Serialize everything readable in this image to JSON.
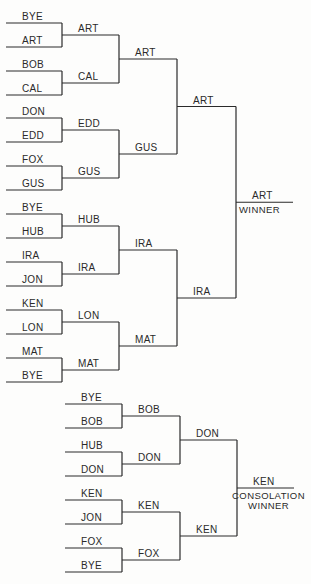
{
  "main_bracket": {
    "rounds": [
      [
        "BYE",
        "ART",
        "BOB",
        "CAL",
        "DON",
        "EDD",
        "FOX",
        "GUS",
        "BYE",
        "HUB",
        "IRA",
        "JON",
        "KEN",
        "LON",
        "MAT",
        "BYE"
      ],
      [
        "ART",
        "CAL",
        "EDD",
        "GUS",
        "HUB",
        "IRA",
        "LON",
        "MAT"
      ],
      [
        "ART",
        "GUS",
        "IRA",
        "MAT"
      ],
      [
        "ART",
        "IRA"
      ],
      [
        "ART"
      ]
    ],
    "winner_caption": [
      "WINNER"
    ]
  },
  "consolation_bracket": {
    "rounds": [
      [
        "BYE",
        "BOB",
        "HUB",
        "DON",
        "KEN",
        "JON",
        "FOX",
        "BYE"
      ],
      [
        "BOB",
        "DON",
        "KEN",
        "FOX"
      ],
      [
        "DON",
        "KEN"
      ],
      [
        "KEN"
      ]
    ],
    "winner_caption": [
      "CONSOLATION",
      "WINNER"
    ]
  }
}
